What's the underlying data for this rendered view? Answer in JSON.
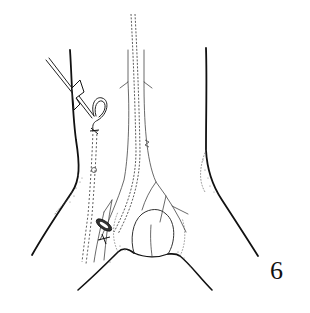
{
  "figure": {
    "number": "6",
    "type": "anatomical line illustration",
    "colors": {
      "ink": "#111111",
      "background": "#ffffff",
      "stipple": "#555555"
    },
    "elements": [
      "torso-outline",
      "vessel-tree",
      "dashed-catheter",
      "catheter-coil",
      "skin-incision",
      "suture-marks"
    ]
  }
}
